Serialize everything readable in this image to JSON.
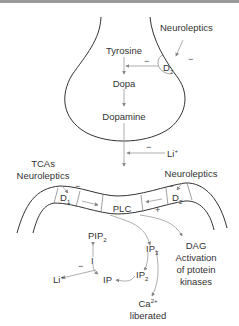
{
  "colors": {
    "outline": "#333333",
    "arrow": "#999999",
    "text": "#333333",
    "topbar": "#9a9a9a"
  },
  "presynaptic": {
    "neuroleptics_label": "Neuroleptics",
    "receptor_label": "D",
    "receptor_sub": "2",
    "inhibit_sign_receptor": "−",
    "inhibit_sign_feedback": "−",
    "synthesis": [
      "Tyrosine",
      "Dopa",
      "Dopamine"
    ]
  },
  "cleft": {
    "lithium_label": "Li",
    "lithium_sup": "+",
    "lithium_sign": "−"
  },
  "postsynaptic": {
    "left_drugs": [
      "TCAs",
      "Neuroleptics"
    ],
    "left_sign": "−",
    "right_drugs": "Neuroleptics",
    "right_sign": "−",
    "d1_label": "D",
    "d1_sub": "1",
    "d2_label": "D",
    "d2_sub": "2",
    "plc_label": "PLC",
    "plc_plus_sign": "+"
  },
  "second_messengers": {
    "pip2": {
      "main": "PIP",
      "sub": "2"
    },
    "i": "I",
    "ip": "IP",
    "ip2": {
      "main": "IP",
      "sub": "2"
    },
    "ip3": {
      "main": "IP",
      "sub": "3"
    },
    "lithium": {
      "main": "Li",
      "sup": "+"
    },
    "lithium_sign": "−",
    "dag": [
      "DAG",
      "Activation",
      "of ptotein",
      "kinases"
    ],
    "calcium": {
      "main": "Ca",
      "sup": "2+",
      "line2": "liberated"
    }
  }
}
